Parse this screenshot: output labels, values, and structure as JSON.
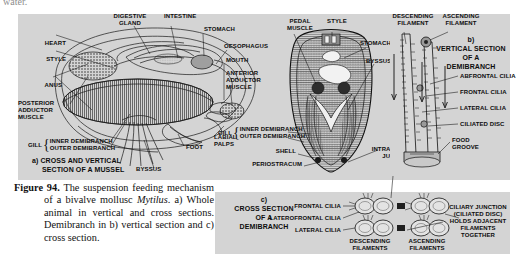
{
  "page": {
    "cut_off_text": "water.",
    "background": "#ffffff",
    "panel_fill": "#d4d4d4"
  },
  "caption": {
    "figure_number": "Figure 94.",
    "text": "The suspension feeding mechanism of a bivalve mollusc Mytilus. a) Whole animal in vertical and cross sections. Demibranch in b) vertical section and c) cross section.",
    "italic_term": "Mytilus"
  },
  "panel_a": {
    "title_line1": "a) CROSS AND VERTICAL",
    "title_line2": "SECTION OF A MUSSEL",
    "labels": [
      {
        "id": "heart",
        "text": "HEART"
      },
      {
        "id": "style",
        "text": "STYLE"
      },
      {
        "id": "anus",
        "text": "ANUS"
      },
      {
        "id": "posterior-adductor-muscle",
        "text": "POSTERIOR\nADDUCTOR\nMUSCLE"
      },
      {
        "id": "digestive-gland",
        "text": "DIGESTIVE\nGLAND"
      },
      {
        "id": "intestine",
        "text": "INTESTINE"
      },
      {
        "id": "stomach",
        "text": "STOMACH"
      },
      {
        "id": "oesophagus",
        "text": "OESOPHAGUS"
      },
      {
        "id": "mouth",
        "text": "MOUTH"
      },
      {
        "id": "anterior-adductor-muscle",
        "text": "ANTERIOR\nADDUCTOR\nMUSCLE"
      },
      {
        "id": "labial-palps",
        "text": "LABIAL\nPALPS"
      },
      {
        "id": "foot",
        "text": "FOOT"
      },
      {
        "id": "byssus",
        "text": "BYSSUS"
      },
      {
        "id": "gill",
        "text": "GILL"
      },
      {
        "id": "inner-demibranch",
        "text": "INNER DEMIBRANCH"
      },
      {
        "id": "outer-demibranch",
        "text": "OUTER DEMIBRANCH"
      }
    ]
  },
  "panel_b": {
    "labels": [
      {
        "id": "pedal-muscle",
        "text": "PEDAL\nMUSCLE"
      },
      {
        "id": "style",
        "text": "STYLE"
      },
      {
        "id": "stomach",
        "text": "STOMACH"
      },
      {
        "id": "byssus",
        "text": "BYSSUS"
      },
      {
        "id": "gill",
        "text": "GILL"
      },
      {
        "id": "inner-demibranch",
        "text": "INNER DEMIBRANCH"
      },
      {
        "id": "outer-demibranch",
        "text": "OUTER DEMIBRANCH"
      },
      {
        "id": "shell",
        "text": "SHELL"
      },
      {
        "id": "periostracum",
        "text": "PERIOSTRACUM"
      },
      {
        "id": "intralamellar-junction",
        "text": "INTRALAMELLAR\nJUNCTION"
      }
    ]
  },
  "panel_c": {
    "title_line1": "b)",
    "title_line2": "VERTICAL SECTION",
    "title_line3": "OF A",
    "title_line4": "DEMIBRANCH",
    "labels": [
      {
        "id": "descending-filament",
        "text": "DESCENDING\nFILAMENT"
      },
      {
        "id": "ascending-filament",
        "text": "ASCENDING\nFILAMENT"
      },
      {
        "id": "abfrontal-cilia",
        "text": "ABFRONTAL CILIA"
      },
      {
        "id": "frontal-cilia",
        "text": "FRONTAL CILIA"
      },
      {
        "id": "lateral-cilia",
        "text": "LATERAL CILIA"
      },
      {
        "id": "ciliated-disc",
        "text": "CILIATED DISC"
      },
      {
        "id": "food-groove",
        "text": "FOOD\nGROOVE"
      }
    ]
  },
  "panel_d": {
    "title_line1": "c)",
    "title_line2": "CROSS SECTION",
    "title_line3": "OF A",
    "title_line4": "DEMIBRANCH",
    "labels": [
      {
        "id": "frontal-cilia",
        "text": "FRONTAL CILIA"
      },
      {
        "id": "laterofrontal-cilia",
        "text": "LATEROFRONTAL CILIA"
      },
      {
        "id": "lateral-cilia",
        "text": "LATERAL CILIA"
      },
      {
        "id": "descending-filaments",
        "text": "DESCENDING\nFILAMENTS"
      },
      {
        "id": "ascending-filaments",
        "text": "ASCENDING\nFILAMENTS"
      },
      {
        "id": "ciliary-junction-note",
        "text": "CILIARY JUNCTION\n(CILIATED DISC)\nHOLDS ADJACENT\nFILAMENTS\nTOGETHER"
      }
    ]
  }
}
